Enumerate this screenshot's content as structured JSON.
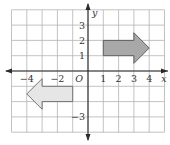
{
  "diagram": {
    "type": "coordinate-grid-transformation",
    "grid": {
      "x_min": -5,
      "x_max": 5,
      "y_min": -4,
      "y_max": 4,
      "unit_px": 15.3,
      "origin_px": [
        88,
        71
      ],
      "line_color": "#b4b4b4"
    },
    "axes": {
      "x_label": "x",
      "y_label": "y",
      "origin_label": "O",
      "color": "#2a2a2a",
      "x_ticks": [
        {
          "value": -4,
          "label": "−4"
        },
        {
          "value": -2,
          "label": "−2"
        },
        {
          "value": 1,
          "label": "1"
        },
        {
          "value": 2,
          "label": "2"
        },
        {
          "value": 3,
          "label": "3"
        },
        {
          "value": 4,
          "label": "4"
        }
      ],
      "y_ticks": [
        {
          "value": 3,
          "label": "3"
        },
        {
          "value": 2,
          "label": "2"
        },
        {
          "value": 1,
          "label": "1"
        },
        {
          "value": -3,
          "label": "−3"
        }
      ]
    },
    "shapes": [
      {
        "name": "right-arrow",
        "fill": "#a8a8a8",
        "stroke": "#555555",
        "points": [
          [
            1,
            1
          ],
          [
            3,
            1
          ],
          [
            3,
            0.5
          ],
          [
            4,
            1.5
          ],
          [
            3,
            2.5
          ],
          [
            3,
            2
          ],
          [
            1,
            2
          ]
        ]
      },
      {
        "name": "left-arrow",
        "fill": "#e6e6e6",
        "stroke": "#666666",
        "points": [
          [
            -1,
            -1
          ],
          [
            -3,
            -1
          ],
          [
            -3,
            -0.5
          ],
          [
            -4,
            -1.5
          ],
          [
            -3,
            -2.5
          ],
          [
            -3,
            -2
          ],
          [
            -1,
            -2
          ]
        ]
      }
    ]
  }
}
